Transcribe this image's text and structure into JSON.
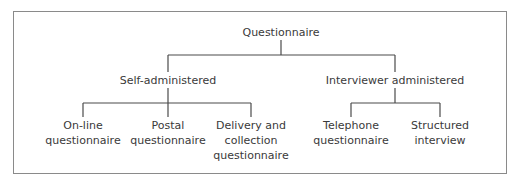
{
  "diagram": {
    "type": "tree",
    "root": {
      "label": "Questionnaire",
      "children": [
        {
          "label": "Self-administered",
          "children": [
            {
              "lines": [
                "On-line",
                "questionnaire"
              ]
            },
            {
              "lines": [
                "Postal",
                "questionnaire"
              ]
            },
            {
              "lines": [
                "Delivery and",
                "collection",
                "questionnaire"
              ]
            }
          ]
        },
        {
          "label": "Interviewer administered",
          "children": [
            {
              "lines": [
                "Telephone",
                "questionnaire"
              ]
            },
            {
              "lines": [
                "Structured",
                "interview"
              ]
            }
          ]
        }
      ]
    },
    "colors": {
      "line": "#4a4a4a",
      "text": "#3a3a3a",
      "border": "#8a8a8a"
    }
  }
}
